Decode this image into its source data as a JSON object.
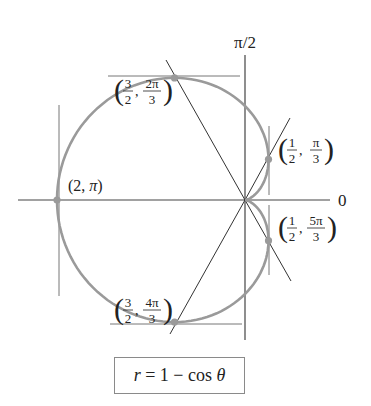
{
  "chart_data": {
    "type": "polar-curve",
    "title": "",
    "equation": "r = 1 − cos θ",
    "equation_parts": {
      "lhs": "r",
      "eq": " = 1 − cos ",
      "theta": "θ"
    },
    "axes": {
      "polar_axis_label": "0",
      "vertical_axis_label": "π/2"
    },
    "points": [
      {
        "r": 2,
        "theta_deg": 180,
        "label": "(2, π)",
        "r_label": "2",
        "theta_label": "π"
      },
      {
        "r": 1.5,
        "theta_deg": 120,
        "label": "(3/2, 2π/3)",
        "r_num": "3",
        "r_den": "2",
        "t_num": "2π",
        "t_den": "3"
      },
      {
        "r": 0.5,
        "theta_deg": 60,
        "label": "(1/2, π/3)",
        "r_num": "1",
        "r_den": "2",
        "t_num": "π",
        "t_den": "3"
      },
      {
        "r": 0.5,
        "theta_deg": 300,
        "label": "(1/2, 5π/3)",
        "r_num": "1",
        "r_den": "2",
        "t_num": "5π",
        "t_den": "3"
      },
      {
        "r": 1.5,
        "theta_deg": 240,
        "label": "(3/2, 4π/3)",
        "r_num": "3",
        "r_den": "2",
        "t_num": "4π",
        "t_den": "3"
      }
    ],
    "tangent_lines": [
      {
        "type": "horizontal",
        "at_point": "(3/2, 2π/3)"
      },
      {
        "type": "horizontal",
        "at_point": "(3/2, 4π/3)"
      },
      {
        "type": "vertical",
        "at_point": "(2, π)"
      },
      {
        "type": "vertical",
        "at_point": "(1/2, π/3)"
      },
      {
        "type": "vertical",
        "at_point": "(1/2, 5π/3)"
      }
    ],
    "radial_lines_deg": [
      60,
      120,
      240,
      300
    ],
    "colors": {
      "curve": "#9a9a9a",
      "points": "#9a9a9a",
      "lines": "#333333",
      "tangents": "#777777"
    }
  }
}
